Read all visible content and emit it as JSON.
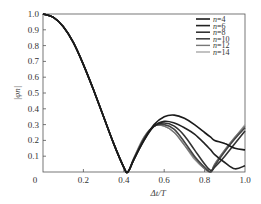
{
  "chart_data": {
    "type": "line",
    "title": "",
    "xlabel": "Δt/T",
    "ylabel": "|φn|",
    "xlim": [
      0,
      1.0
    ],
    "ylim": [
      0,
      1.0
    ],
    "grid": false,
    "legend_position": "upper right",
    "x_ticks": [
      "0",
      "0.2",
      "0.4",
      "0.6",
      "0.8",
      "1.0"
    ],
    "y_ticks": [
      "0.1",
      "0.2",
      "0.3",
      "0.4",
      "0.5",
      "0.6",
      "0.7",
      "0.8",
      "0.9",
      "1.0"
    ],
    "x": [
      0,
      0.05,
      0.1,
      0.15,
      0.2,
      0.25,
      0.3,
      0.35,
      0.4,
      0.42,
      0.45,
      0.5,
      0.55,
      0.6,
      0.65,
      0.7,
      0.75,
      0.8,
      0.83,
      0.85,
      0.9,
      0.95,
      1.0
    ],
    "series": [
      {
        "name": "n=4",
        "color": "#1a1a1a",
        "width": 1.6,
        "values": [
          1.0,
          0.98,
          0.92,
          0.82,
          0.68,
          0.52,
          0.35,
          0.18,
          0.03,
          0.0,
          0.08,
          0.2,
          0.3,
          0.35,
          0.36,
          0.34,
          0.3,
          0.25,
          0.22,
          0.2,
          0.18,
          0.15,
          0.14
        ]
      },
      {
        "name": "n=6",
        "color": "#222222",
        "width": 1.6,
        "values": [
          1.0,
          0.98,
          0.92,
          0.82,
          0.68,
          0.52,
          0.35,
          0.18,
          0.03,
          0.0,
          0.08,
          0.2,
          0.29,
          0.32,
          0.31,
          0.28,
          0.24,
          0.18,
          0.14,
          0.11,
          0.06,
          0.02,
          0.04
        ]
      },
      {
        "name": "n=8",
        "color": "#333333",
        "width": 1.6,
        "values": [
          1.0,
          0.98,
          0.92,
          0.82,
          0.68,
          0.52,
          0.35,
          0.18,
          0.03,
          0.0,
          0.08,
          0.21,
          0.29,
          0.31,
          0.29,
          0.23,
          0.14,
          0.05,
          0.01,
          0.03,
          0.1,
          0.18,
          0.26
        ]
      },
      {
        "name": "n=10",
        "color": "#444444",
        "width": 1.6,
        "values": [
          1.0,
          0.98,
          0.92,
          0.82,
          0.68,
          0.52,
          0.35,
          0.18,
          0.03,
          0.0,
          0.08,
          0.21,
          0.29,
          0.3,
          0.27,
          0.19,
          0.1,
          0.03,
          0.0,
          0.04,
          0.13,
          0.21,
          0.28
        ]
      },
      {
        "name": "n=12",
        "color": "#777777",
        "width": 1.4,
        "values": [
          1.0,
          0.98,
          0.92,
          0.82,
          0.68,
          0.52,
          0.35,
          0.18,
          0.03,
          0.0,
          0.09,
          0.22,
          0.29,
          0.29,
          0.25,
          0.17,
          0.09,
          0.02,
          0.0,
          0.05,
          0.14,
          0.22,
          0.29
        ]
      },
      {
        "name": "n=14",
        "color": "#999999",
        "width": 1.2,
        "values": [
          1.0,
          0.98,
          0.92,
          0.82,
          0.68,
          0.52,
          0.35,
          0.18,
          0.03,
          0.0,
          0.09,
          0.22,
          0.29,
          0.29,
          0.25,
          0.17,
          0.08,
          0.02,
          0.0,
          0.05,
          0.14,
          0.22,
          0.3
        ]
      }
    ]
  },
  "legend": {
    "items": [
      {
        "label": "n=4"
      },
      {
        "label": "n=6"
      },
      {
        "label": "n=8"
      },
      {
        "label": "n=10"
      },
      {
        "label": "n=12"
      },
      {
        "label": "n=14"
      }
    ]
  },
  "axes": {
    "x_title": "Δt/T",
    "y_title": "|φn|",
    "origin_label": "0"
  }
}
